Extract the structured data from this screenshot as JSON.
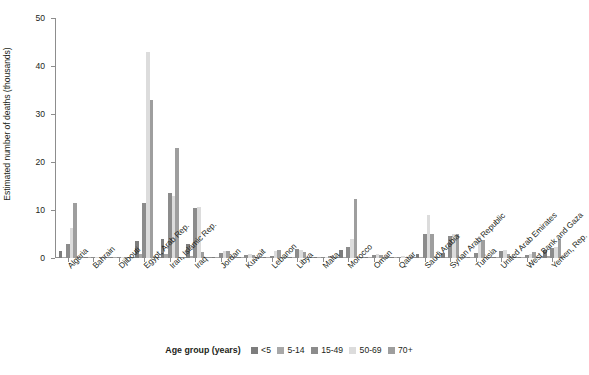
{
  "chart_data": {
    "type": "bar",
    "title": "",
    "xlabel": "",
    "ylabel": "Estimated number of deaths (thousands)",
    "ylim": [
      0,
      50
    ],
    "yticks": [
      0,
      10,
      20,
      30,
      40,
      50
    ],
    "grid": false,
    "legend_position": "bottom",
    "legend_title": "Age group (years)",
    "categories": [
      "Algeria",
      "Bahrain",
      "Djibouti",
      "Egypt, Arab Rep.",
      "Iran, Islamic Rep.",
      "Iraq",
      "Jordan",
      "Kuwait",
      "Lebanon",
      "Libya",
      "Malta",
      "Morocco",
      "Oman",
      "Qatar",
      "Saudi Arabia",
      "Syrian Arab Republic",
      "Tunisia",
      "United Arab Emirates",
      "West Bank and Gaza",
      "Yemen, Rep."
    ],
    "series": [
      {
        "name": "<5",
        "color": "#7d7d7d",
        "values": [
          1.5,
          0.1,
          0.2,
          3.6,
          4.0,
          3.0,
          0.2,
          0.1,
          0.1,
          0.3,
          0.05,
          1.6,
          0.15,
          0.05,
          0.9,
          1.0,
          0.3,
          0.2,
          0.3,
          1.6
        ]
      },
      {
        "name": "5-14",
        "color": "#a8a8a8",
        "values": [
          0.3,
          0.05,
          0.1,
          0.8,
          0.8,
          0.5,
          0.1,
          0.05,
          0.05,
          0.1,
          0.02,
          0.3,
          0.05,
          0.02,
          0.3,
          0.3,
          0.1,
          0.1,
          0.1,
          0.4
        ]
      },
      {
        "name": "15-49",
        "color": "#8c8c8c",
        "values": [
          3.0,
          0.2,
          0.2,
          11.5,
          13.5,
          10.5,
          1.0,
          0.7,
          0.5,
          1.8,
          0.1,
          2.2,
          0.7,
          0.3,
          5.0,
          4.5,
          1.0,
          1.5,
          0.6,
          2.0
        ]
      },
      {
        "name": "50-69",
        "color": "#dcdcdc",
        "values": [
          6.2,
          0.3,
          0.15,
          43.0,
          13.0,
          10.6,
          1.5,
          0.9,
          1.5,
          1.7,
          0.2,
          4.0,
          0.9,
          0.35,
          9.0,
          5.0,
          4.6,
          1.7,
          0.9,
          2.3
        ]
      },
      {
        "name": "70+",
        "color": "#9e9e9e",
        "values": [
          11.5,
          0.2,
          0.1,
          33.0,
          23.0,
          1.2,
          1.5,
          0.6,
          1.7,
          1.3,
          0.5,
          12.3,
          0.6,
          0.2,
          5.0,
          5.0,
          3.8,
          0.8,
          1.3,
          4.0
        ]
      }
    ]
  }
}
